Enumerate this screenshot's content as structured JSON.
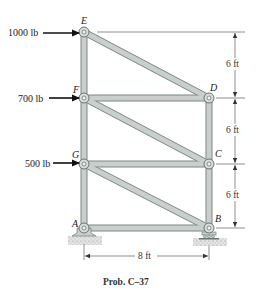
{
  "diagram": {
    "type": "truss",
    "caption": "Prob. C–37",
    "colors": {
      "member_fill": "#c9cfcc",
      "member_edge": "#7d8784",
      "pin": "#d9dedb",
      "text": "#222222",
      "ground": "#cfcfcf"
    },
    "nodes": [
      {
        "id": "E",
        "label": "E",
        "x": 84,
        "y": 32
      },
      {
        "id": "F",
        "label": "F",
        "x": 84,
        "y": 98
      },
      {
        "id": "G",
        "label": "G",
        "x": 84,
        "y": 164
      },
      {
        "id": "A",
        "label": "A",
        "x": 84,
        "y": 228
      },
      {
        "id": "D",
        "label": "D",
        "x": 209,
        "y": 98
      },
      {
        "id": "C",
        "label": "C",
        "x": 209,
        "y": 164
      },
      {
        "id": "B",
        "label": "B",
        "x": 209,
        "y": 228
      }
    ],
    "members": [
      [
        "E",
        "F"
      ],
      [
        "F",
        "G"
      ],
      [
        "G",
        "A"
      ],
      [
        "D",
        "C"
      ],
      [
        "C",
        "B"
      ],
      [
        "F",
        "D"
      ],
      [
        "G",
        "C"
      ],
      [
        "A",
        "B"
      ],
      [
        "E",
        "D"
      ],
      [
        "F",
        "C"
      ],
      [
        "G",
        "B"
      ]
    ],
    "loads": [
      {
        "node": "E",
        "label": "1000 lb",
        "direction": "right"
      },
      {
        "node": "F",
        "label": "700 lb",
        "direction": "right"
      },
      {
        "node": "G",
        "label": "500 lb",
        "direction": "right"
      }
    ],
    "supports": [
      {
        "node": "A",
        "type": "pin"
      },
      {
        "node": "B",
        "type": "roller"
      }
    ],
    "dimensions": {
      "vertical": [
        {
          "label": "6 ft",
          "from": "E",
          "to": "D-level"
        },
        {
          "label": "6 ft",
          "from": "D-level",
          "to": "C-level"
        },
        {
          "label": "6 ft",
          "from": "C-level",
          "to": "B-level"
        }
      ],
      "horizontal": {
        "label": "8 ft",
        "from": "A",
        "to": "B"
      }
    }
  }
}
